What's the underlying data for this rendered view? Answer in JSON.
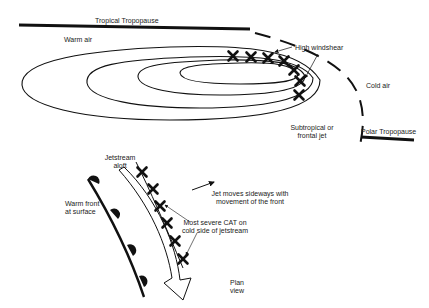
{
  "diagram": {
    "cross_section": {
      "labels": {
        "tropical_tropopause": "Tropical Tropopause",
        "warm_air": "Warm air",
        "high_windshear": "High windshear",
        "cold_air": "Cold air",
        "subtropical_jet_line1": "Subtropical or",
        "subtropical_jet_line2": "frontal jet",
        "polar_tropopause": "Polar Tropopause"
      },
      "contour_count": 4,
      "windshear_marker_count": 7
    },
    "plan_view": {
      "labels": {
        "jetstream_line1": "Jetstream",
        "jetstream_line2": "aloft",
        "warm_front_line1": "Warm front",
        "warm_front_line2": "at surface",
        "jet_moves_line1": "Jet moves sideways with",
        "jet_moves_line2": "movement of the front",
        "cat_line1": "Most severe CAT on",
        "cat_line2": "cold side of jetstream",
        "plan_line1": "Plan",
        "plan_line2": "view"
      },
      "cat_marker_count": 6,
      "warm_front_bump_count": 4
    },
    "colors": {
      "ink": "#111111",
      "background": "#ffffff"
    }
  }
}
